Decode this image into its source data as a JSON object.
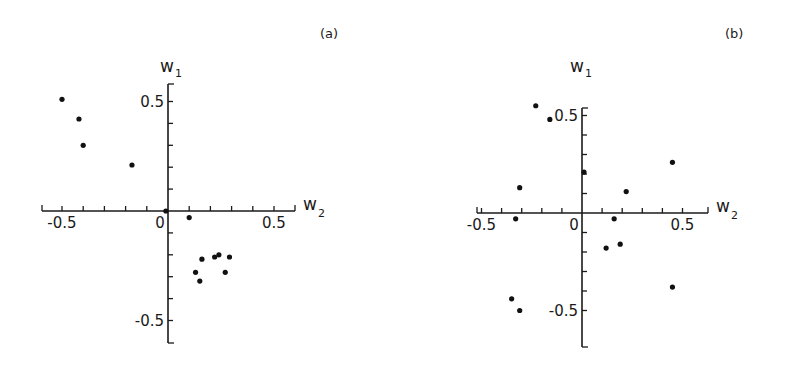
{
  "chart_data": [
    {
      "type": "scatter",
      "panel_label": "(a)",
      "title": "",
      "xlabel": "W",
      "xlabel_sub": "2",
      "ylabel": "W",
      "ylabel_sub": "1",
      "xlim": [
        -0.6,
        0.6
      ],
      "ylim": [
        -0.6,
        0.6
      ],
      "x_tick_labels": [
        "-0.5",
        "0",
        "0.5"
      ],
      "y_tick_labels": [
        "0.5",
        "-0.5"
      ],
      "minor_tick_step": 0.1,
      "grid": false,
      "points": [
        {
          "x": -0.5,
          "y": 0.51
        },
        {
          "x": -0.42,
          "y": 0.42
        },
        {
          "x": -0.4,
          "y": 0.3
        },
        {
          "x": -0.17,
          "y": 0.21
        },
        {
          "x": -0.01,
          "y": 0.0
        },
        {
          "x": 0.1,
          "y": -0.03
        },
        {
          "x": 0.16,
          "y": -0.22
        },
        {
          "x": 0.13,
          "y": -0.28
        },
        {
          "x": 0.15,
          "y": -0.32
        },
        {
          "x": 0.22,
          "y": -0.21
        },
        {
          "x": 0.24,
          "y": -0.2
        },
        {
          "x": 0.29,
          "y": -0.21
        },
        {
          "x": 0.27,
          "y": -0.28
        }
      ]
    },
    {
      "type": "scatter",
      "panel_label": "(b)",
      "title": "",
      "xlabel": "W",
      "xlabel_sub": "2",
      "ylabel": "W",
      "ylabel_sub": "1",
      "xlim": [
        -0.6,
        0.6
      ],
      "ylim": [
        -0.6,
        0.6
      ],
      "x_tick_labels": [
        "-0.5",
        "0",
        "0.5"
      ],
      "y_tick_labels": [
        "0.5",
        "-0.5"
      ],
      "minor_tick_step": 0.1,
      "grid": false,
      "points": [
        {
          "x": -0.23,
          "y": 0.55
        },
        {
          "x": -0.16,
          "y": 0.48
        },
        {
          "x": 0.01,
          "y": 0.21
        },
        {
          "x": -0.31,
          "y": 0.13
        },
        {
          "x": -0.33,
          "y": -0.03
        },
        {
          "x": 0.45,
          "y": 0.26
        },
        {
          "x": 0.22,
          "y": 0.11
        },
        {
          "x": 0.16,
          "y": -0.03
        },
        {
          "x": 0.12,
          "y": -0.18
        },
        {
          "x": 0.19,
          "y": -0.16
        },
        {
          "x": 0.45,
          "y": -0.38
        },
        {
          "x": -0.35,
          "y": -0.44
        },
        {
          "x": -0.31,
          "y": -0.5
        }
      ]
    }
  ],
  "layout": [
    {
      "origin": [
        168,
        211
      ],
      "px_per_unit_x": 212,
      "px_per_unit_y": 219,
      "x_axis_range_px": [
        42,
        295
      ],
      "y_axis_range_px": [
        84,
        343
      ],
      "panel_label_pos": [
        320,
        38
      ],
      "ylabel_pos": [
        160,
        72
      ],
      "xlabel_pos": [
        303,
        216
      ]
    },
    {
      "origin": [
        582,
        213
      ],
      "px_per_unit_x": 201,
      "px_per_unit_y": 195,
      "x_axis_range_px": [
        477,
        708
      ],
      "y_axis_range_px": [
        108,
        347
      ],
      "panel_label_pos": [
        725,
        38
      ],
      "ylabel_pos": [
        570,
        72
      ],
      "xlabel_pos": [
        716,
        218
      ]
    }
  ]
}
